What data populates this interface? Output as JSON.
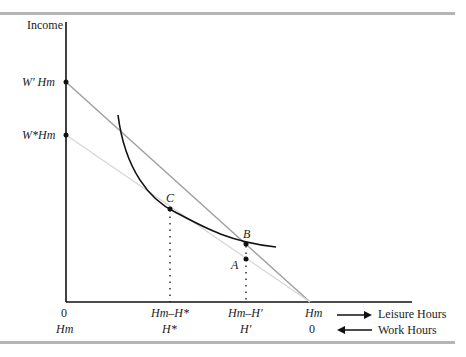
{
  "diagram": {
    "y_axis_label": "Income",
    "y_ticks": [
      {
        "label": "W' H_m",
        "display": "W′ Hm"
      },
      {
        "label": "W* H_m",
        "display": "W*Hm"
      }
    ],
    "points": {
      "A": "A",
      "B": "B",
      "C": "C"
    },
    "x_ticks_leisure": [
      "0",
      "Hm–H*",
      "Hm–H′",
      "Hm"
    ],
    "x_ticks_work": [
      "Hm",
      "H*",
      "H′",
      "0"
    ],
    "leisure_label": "Leisure Hours",
    "work_label": "Work Hours",
    "colors": {
      "axis": "#111111",
      "budget_high": "#a0a0a0",
      "budget_low": "#d8d8d8",
      "curve": "#111111",
      "rule": "#b5b5b5"
    }
  }
}
